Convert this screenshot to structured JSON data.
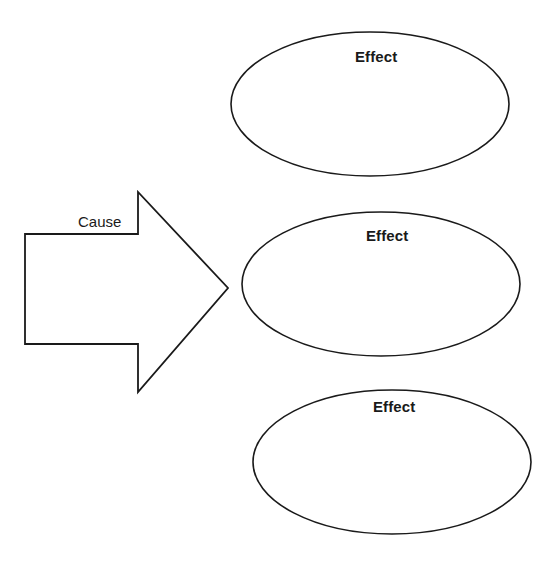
{
  "diagram": {
    "type": "cause-and-effect-graphic-organizer",
    "background_color": "#ffffff",
    "stroke_color": "#1a1a1a",
    "text_color": "#1a1a1a",
    "cause": {
      "label": "Cause",
      "shape": "block-arrow-right",
      "label_x": 78,
      "label_y": 214
    },
    "effects": [
      {
        "label": "Effect",
        "shape": "ellipse",
        "cx": 370,
        "cy": 104,
        "rx": 139,
        "ry": 72,
        "label_x": 355,
        "label_y": 49
      },
      {
        "label": "Effect",
        "shape": "ellipse",
        "cx": 381,
        "cy": 284,
        "rx": 139,
        "ry": 72,
        "label_x": 366,
        "label_y": 228
      },
      {
        "label": "Effect",
        "shape": "ellipse",
        "cx": 392,
        "cy": 462,
        "rx": 139,
        "ry": 72,
        "label_x": 373,
        "label_y": 399
      }
    ]
  }
}
